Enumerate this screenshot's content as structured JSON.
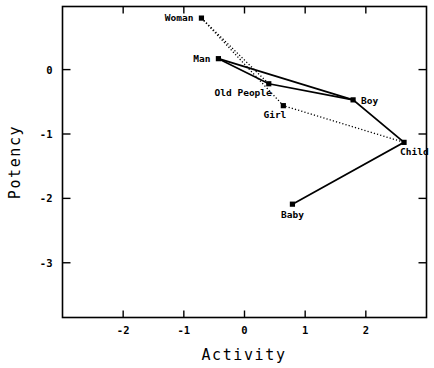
{
  "chart_data": {
    "type": "scatter",
    "title": "",
    "xlabel": "Activity",
    "ylabel": "Potency",
    "xlim": [
      -3.0,
      3.0
    ],
    "ylim": [
      -3.85,
      0.98
    ],
    "xticks": [
      -2,
      -1,
      0,
      1,
      2
    ],
    "xticklabels": [
      "-2",
      "-1",
      "0",
      "1",
      "2"
    ],
    "yticks": [
      0,
      -1,
      -2,
      -3
    ],
    "yticklabels": [
      "0",
      "-1",
      "-2",
      "-3"
    ],
    "grid": false,
    "legend": null,
    "points": [
      {
        "label": "Woman",
        "x": -0.71,
        "y": 0.8,
        "label_pos": "left"
      },
      {
        "label": "Man",
        "x": -0.43,
        "y": 0.17,
        "label_pos": "left"
      },
      {
        "label": "Old People",
        "x": 0.4,
        "y": -0.22,
        "label_pos": "below-left"
      },
      {
        "label": "Girl",
        "x": 0.64,
        "y": -0.56,
        "label_pos": "below-left"
      },
      {
        "label": "Boy",
        "x": 1.79,
        "y": -0.47,
        "label_pos": "right"
      },
      {
        "label": "Child",
        "x": 2.63,
        "y": -1.13,
        "label_pos": "below-right"
      },
      {
        "label": "Baby",
        "x": 0.79,
        "y": -2.09,
        "label_pos": "below"
      }
    ],
    "series": [
      {
        "name": "solid-path",
        "style": "solid",
        "path": [
          "Man",
          "Old People",
          "Boy",
          "Child",
          "Baby"
        ]
      },
      {
        "name": "dotted-path-a",
        "style": "dotted",
        "path": [
          "Woman",
          "Old People"
        ]
      },
      {
        "name": "dotted-path-b",
        "style": "dotted",
        "path": [
          "Woman",
          "Girl",
          "Child"
        ]
      },
      {
        "name": "solid-branch",
        "style": "solid",
        "path": [
          "Man",
          "Boy"
        ]
      }
    ]
  }
}
